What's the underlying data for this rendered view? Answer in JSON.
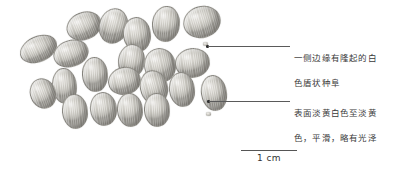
{
  "figure": {
    "kind": "botanical-specimen-photo-plate",
    "background_color": "#ffffff"
  },
  "annotations": [
    {
      "id": "caruncle-note",
      "line1": "一侧边缘有隆起的白",
      "line2": "色盾状种阜",
      "text_color": "#3a3a3a",
      "leader_color": "#5a5a5a"
    },
    {
      "id": "surface-note",
      "line1": "表面淡黄白色至淡黄",
      "line2": "色，平滑，略有光泽",
      "text_color": "#3a3a3a",
      "leader_color": "#5a5a5a"
    }
  ],
  "scale": {
    "label": "1 cm",
    "bar_color": "#555555"
  },
  "seeds": [
    {
      "x": 66,
      "y": 12,
      "w": 34,
      "h": 26,
      "rot": -22
    },
    {
      "x": 99,
      "y": 8,
      "w": 27,
      "h": 34,
      "rot": 14
    },
    {
      "x": 123,
      "y": 17,
      "w": 26,
      "h": 33,
      "rot": -8
    },
    {
      "x": 152,
      "y": 6,
      "w": 26,
      "h": 34,
      "rot": 6
    },
    {
      "x": 183,
      "y": 6,
      "w": 36,
      "h": 30,
      "rot": -16
    },
    {
      "x": 19,
      "y": 36,
      "w": 37,
      "h": 24,
      "rot": -24
    },
    {
      "x": 53,
      "y": 40,
      "w": 34,
      "h": 25,
      "rot": -18
    },
    {
      "x": 118,
      "y": 44,
      "w": 25,
      "h": 32,
      "rot": 8
    },
    {
      "x": 82,
      "y": 57,
      "w": 24,
      "h": 33,
      "rot": -4
    },
    {
      "x": 144,
      "y": 48,
      "w": 30,
      "h": 33,
      "rot": -12
    },
    {
      "x": 175,
      "y": 48,
      "w": 33,
      "h": 28,
      "rot": -8
    },
    {
      "x": 201,
      "y": 75,
      "w": 24,
      "h": 34,
      "rot": -10
    },
    {
      "x": 52,
      "y": 68,
      "w": 23,
      "h": 34,
      "rot": -6
    },
    {
      "x": 108,
      "y": 67,
      "w": 31,
      "h": 26,
      "rot": -12
    },
    {
      "x": 140,
      "y": 70,
      "w": 26,
      "h": 33,
      "rot": -14
    },
    {
      "x": 169,
      "y": 72,
      "w": 24,
      "h": 33,
      "rot": -8
    },
    {
      "x": 30,
      "y": 78,
      "w": 24,
      "h": 29,
      "rot": -20
    },
    {
      "x": 62,
      "y": 94,
      "w": 24,
      "h": 33,
      "rot": -6
    },
    {
      "x": 90,
      "y": 92,
      "w": 25,
      "h": 32,
      "rot": -8
    },
    {
      "x": 117,
      "y": 93,
      "w": 24,
      "h": 32,
      "rot": -6
    },
    {
      "x": 144,
      "y": 93,
      "w": 24,
      "h": 32,
      "rot": -4
    }
  ]
}
